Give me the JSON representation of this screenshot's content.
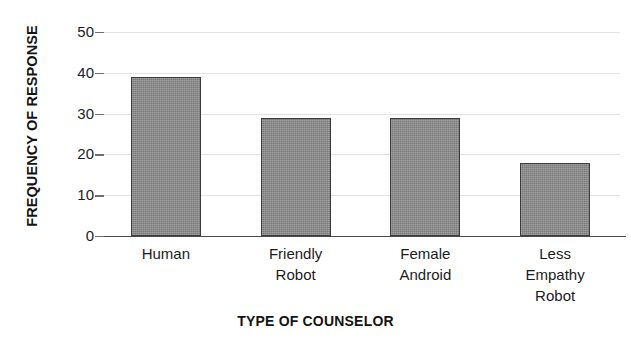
{
  "chart_data": {
    "type": "bar",
    "title": "",
    "xlabel": "TYPE OF COUNSELOR",
    "ylabel": "FREQUENCY OF RESPONSE",
    "categories": [
      "Human",
      "Friendly Robot",
      "Female Android",
      "Less Empathy Robot"
    ],
    "category_lines": [
      [
        "Human"
      ],
      [
        "Friendly",
        "Robot"
      ],
      [
        "Female",
        "Android"
      ],
      [
        "Less",
        "Empathy",
        "Robot"
      ]
    ],
    "values": [
      39,
      29,
      29,
      18
    ],
    "ylim": [
      0,
      50
    ],
    "y_ticks": [
      0,
      10,
      20,
      30,
      40,
      50
    ],
    "y_tick_labels": [
      "0",
      "10",
      "20",
      "30",
      "40",
      "50"
    ],
    "grid": true,
    "grid_axis": "y",
    "legend": "none",
    "bar_color": "#8a8a8a",
    "bar_border_color": "#3c3c3c",
    "gridline_color": "#e2e2e4",
    "axis_color": "#4a4a4a",
    "text_color": "#1c1c1c",
    "background": "#ffffff"
  }
}
